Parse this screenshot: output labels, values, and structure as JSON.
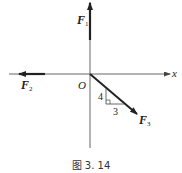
{
  "figure": {
    "caption": "图 3. 14",
    "axes": {
      "x_label": "x",
      "origin_label": "O"
    },
    "vectors": [
      {
        "name": "F1",
        "base": "F",
        "sub": "1",
        "direction": "up"
      },
      {
        "name": "F2",
        "base": "F",
        "sub": "2",
        "direction": "left"
      },
      {
        "name": "F3",
        "base": "F",
        "sub": "3",
        "direction": "down-right",
        "slope_rise": "4",
        "slope_run": "3"
      }
    ],
    "triangle": {
      "vertical_leg": "4",
      "horizontal_leg": "3"
    },
    "colors": {
      "line": "#222222",
      "axis": "#444444",
      "background": "#ffffff"
    }
  }
}
